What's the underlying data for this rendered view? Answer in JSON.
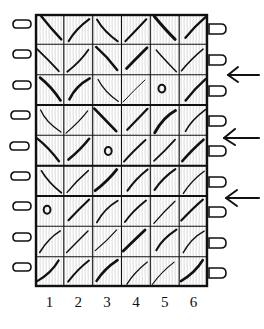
{
  "figure": {
    "title": "",
    "type": "knitting-stitch-chart",
    "background_color": "#ffffff",
    "ink_color": "#111111"
  },
  "chart": {
    "columns": 6,
    "rows": 9,
    "grid": {
      "x": 35,
      "y": 14,
      "width": 173,
      "height": 273,
      "cell_width": 28.83,
      "cell_height": 30.33,
      "border_color": "#111111",
      "border_width": 2.2,
      "cell_line_width": 1.1
    },
    "symbol_legend": {
      "backslash": "left-leaning-decrease",
      "slash": "right-leaning-decrease",
      "circle": "yarn-over"
    },
    "cells": [
      [
        "backslash",
        "slash",
        "backslash",
        "slash",
        "backslash",
        "slash"
      ],
      [
        "backslash",
        "slash",
        "backslash",
        "slash",
        "backslash",
        "slash"
      ],
      [
        "backslash",
        "slash",
        "backslash",
        "slash",
        "circle",
        "slash"
      ],
      [
        "backslash",
        "slash",
        "backslash",
        "slash",
        "slash",
        "slash"
      ],
      [
        "backslash",
        "slash",
        "circle",
        "slash",
        "slash",
        "slash"
      ],
      [
        "backslash",
        "slash",
        "slash",
        "slash",
        "slash",
        "slash"
      ],
      [
        "circle",
        "slash",
        "slash",
        "slash",
        "slash",
        "slash"
      ],
      [
        "slash",
        "slash",
        "slash",
        "slash",
        "slash",
        "slash"
      ],
      [
        "slash",
        "slash",
        "slash",
        "slash",
        "slash",
        "slash"
      ]
    ]
  },
  "column_labels": [
    "1",
    "2",
    "3",
    "4",
    "5",
    "6"
  ],
  "edge_loops": {
    "left_count": 9,
    "right_count": 9,
    "description": "selvedge-loop"
  },
  "arrows": {
    "count": 3,
    "direction": "left",
    "rows_marked": [
      2,
      4,
      6
    ],
    "y_positions": [
      75,
      138,
      198
    ]
  }
}
